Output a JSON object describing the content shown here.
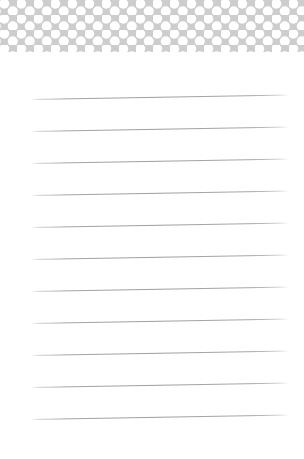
{
  "page": {
    "width": 304,
    "height": 459,
    "background_color": "#ffffff",
    "content_text": ""
  },
  "header": {
    "name": "polka-dot-header-band",
    "band_color": "#cdcdcd",
    "dot_color": "#ffffff",
    "band_height": 52,
    "dot_diameter": 10,
    "dot_pitch_x": 17,
    "dot_pitch_y": 15,
    "row_offset": 8.5
  },
  "ruled_area": {
    "name": "ruled-writing-area",
    "line_color": "#9e9e9e",
    "line_count": 11,
    "line_thickness": 1,
    "left_inset": 30,
    "right_inset": 14,
    "slant_degrees": -1.0,
    "lines": [
      {
        "id": "rule-line-1",
        "label": "Ruled line 1",
        "y": 47
      },
      {
        "id": "rule-line-2",
        "label": "Ruled line 2",
        "y": 79
      },
      {
        "id": "rule-line-3",
        "label": "Ruled line 3",
        "y": 111
      },
      {
        "id": "rule-line-4",
        "label": "Ruled line 4",
        "y": 143
      },
      {
        "id": "rule-line-5",
        "label": "Ruled line 5",
        "y": 175
      },
      {
        "id": "rule-line-6",
        "label": "Ruled line 6",
        "y": 207
      },
      {
        "id": "rule-line-7",
        "label": "Ruled line 7",
        "y": 239
      },
      {
        "id": "rule-line-8",
        "label": "Ruled line 8",
        "y": 271
      },
      {
        "id": "rule-line-9",
        "label": "Ruled line 9",
        "y": 303
      },
      {
        "id": "rule-line-10",
        "label": "Ruled line 10",
        "y": 335
      },
      {
        "id": "rule-line-11",
        "label": "Ruled line 11",
        "y": 367
      }
    ]
  }
}
